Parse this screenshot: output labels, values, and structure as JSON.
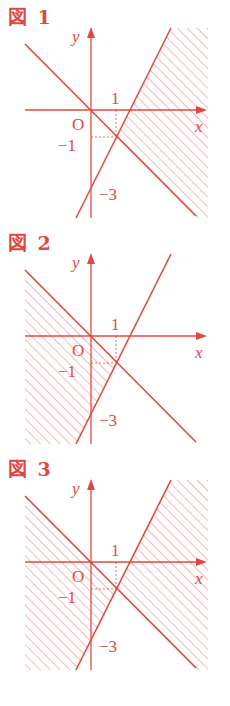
{
  "colors": {
    "ink": "#E2473F",
    "hatch": "#EE8A86"
  },
  "common_labels": {
    "x_axis": "x",
    "y_axis": "y",
    "origin": "O",
    "x_tick": "1",
    "y_tick": "−1",
    "y_intercept": "−3"
  },
  "figures": [
    {
      "title": "図 1",
      "lines": [
        "y = -x",
        "y = 2x - 3"
      ],
      "shaded_region": "right of both lines (y > 2x-3 is false; x large side): y < 2x-3 ... region to the right of y=2x-3 and below/right of y=-x",
      "intersection": [
        1,
        -1
      ]
    },
    {
      "title": "図 2",
      "lines": [
        "y = -x",
        "y = 2x - 3"
      ],
      "shaded_region": "left of both lines",
      "intersection": [
        1,
        -1
      ]
    },
    {
      "title": "図 3",
      "lines": [
        "y = -x",
        "y = 2x - 3"
      ],
      "shaded_region": "union of left and right regions (excluding top and bottom wedges)",
      "intersection": [
        1,
        -1
      ]
    }
  ]
}
